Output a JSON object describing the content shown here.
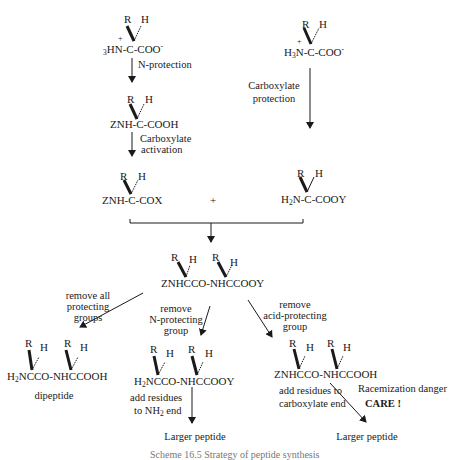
{
  "molecules": {
    "start_left": {
      "prefix_sub": "3",
      "prefix": "HN-C-COO",
      "charge_plus": "+",
      "charge_minus": "-",
      "R": "R",
      "H": "H"
    },
    "start_right": {
      "prefix": "H",
      "sub": "3",
      "rest": "N-C-COO",
      "charge_plus": "+",
      "charge_minus": "-",
      "R": "R",
      "H": "H"
    },
    "z_protected": {
      "text": "ZNH-C-COOH",
      "R": "R",
      "H": "H"
    },
    "activated": {
      "text": "ZNH-C-COX",
      "R": "R",
      "H": "H"
    },
    "y_protected": {
      "prefix": "H",
      "sub": "2",
      "rest": "N-C-COOY",
      "R": "R",
      "H": "H"
    },
    "coupled": {
      "text": "ZNHCCO-NHCCOOY",
      "R1": "R",
      "H1": "H",
      "R2": "R",
      "H2": "H"
    },
    "dipeptide": {
      "prefix": "H",
      "sub": "2",
      "rest": "NCCO-NHCCOOH",
      "R1": "R",
      "H1": "H",
      "R2": "R",
      "H2": "H",
      "label": "dipeptide"
    },
    "n_free": {
      "prefix": "H",
      "sub": "2",
      "rest": "NCCO-NHCCOOY",
      "R1": "R",
      "H1": "H",
      "R2": "R",
      "H2": "H"
    },
    "c_free": {
      "text": "ZNHCCO-NHCCOOH",
      "R1": "R",
      "H1": "H",
      "R2": "R",
      "H2": "H"
    }
  },
  "plus_sign": "+",
  "steps": {
    "n_protection": "N-protection",
    "carboxylate_activation_1": "Carboxylate",
    "carboxylate_activation_2": "activation",
    "carboxylate_protection_1": "Carboxylate",
    "carboxylate_protection_2": "protection",
    "remove_all_1": "remove all",
    "remove_all_2": "protecting",
    "remove_all_3": "groups",
    "remove_n_1": "remove",
    "remove_n_2": "N-protecting",
    "remove_n_3": "group",
    "remove_acid_1": "remove",
    "remove_acid_2": "acid-protecting",
    "remove_acid_3": "group",
    "add_nh2_1": "add residues",
    "add_nh2_2_prefix": "to NH",
    "add_nh2_2_sub": "2",
    "add_nh2_2_suffix": " end",
    "add_cooh_1": "add residues to",
    "add_cooh_2": "carboxylate end",
    "racemization": "Racemization danger",
    "care": "CARE !"
  },
  "products": {
    "larger_left": "Larger peptide",
    "larger_right": "Larger peptide"
  },
  "caption": "Scheme 16.5  Strategy of peptide synthesis"
}
